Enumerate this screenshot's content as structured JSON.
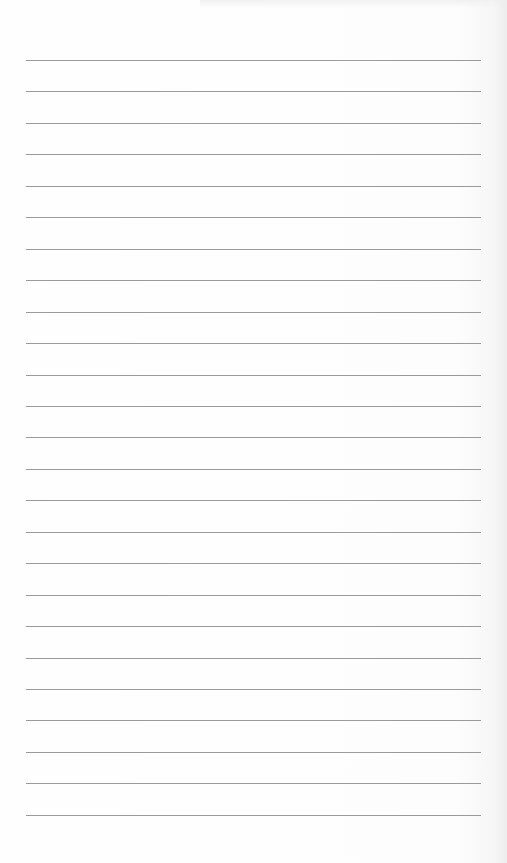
{
  "document": {
    "type": "lined-paper",
    "line_count": 25,
    "first_line_y": 60,
    "line_spacing": 31.45,
    "line_left": 26,
    "line_width": 455,
    "line_color": "#9a9a9a",
    "paper_color": "#fdfdfd",
    "text": []
  }
}
